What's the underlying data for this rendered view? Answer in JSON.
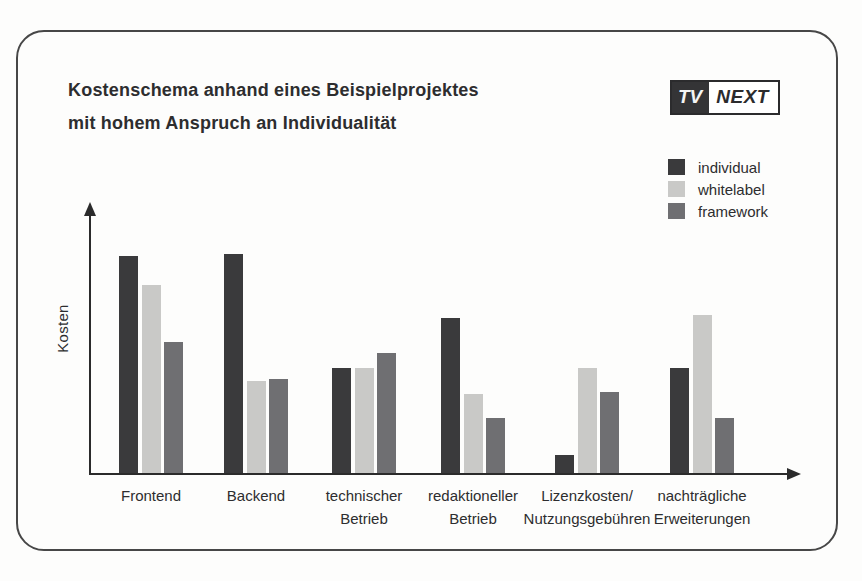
{
  "header": {
    "title_line1": "Kostenschema anhand eines Beispielprojektes",
    "title_line2": "mit hohem Anspruch an Individualität"
  },
  "logo": {
    "left_text": "TV",
    "right_text": "NEXT"
  },
  "colors": {
    "ink": "#2d2d2f",
    "axis": "#2b2b2b",
    "card_border": "#474747",
    "background": "#fdfdfc",
    "individual": "#3a3a3c",
    "whitelabel": "#c9c9c7",
    "framework": "#6f6f72"
  },
  "chart_data": {
    "type": "bar",
    "title": "Kostenschema anhand eines Beispielprojektes mit hohem Anspruch an Individualität",
    "xlabel": "",
    "ylabel": "Kosten",
    "ylim": [
      0,
      110
    ],
    "y_ticks": [],
    "grid": false,
    "legend_position": "top-right",
    "value_units": "relative (no numeric scale shown)",
    "categories": [
      "Frontend",
      "Backend",
      "technischer Betrieb",
      "redaktioneller Betrieb",
      "Lizenzkosten/Nutzungsgebühren",
      "nachträgliche Erweiterungen"
    ],
    "category_label_lines": [
      [
        "Frontend"
      ],
      [
        "Backend"
      ],
      [
        "technischer",
        "Betrieb"
      ],
      [
        "redaktioneller",
        "Betrieb"
      ],
      [
        "Lizenzkosten/",
        "Nutzungsgebühren"
      ],
      [
        "nachträgliche",
        "Erweiterungen"
      ]
    ],
    "series": [
      {
        "name": "individual",
        "color": "#3a3a3c",
        "values": [
          99,
          100,
          48,
          71,
          8,
          48
        ]
      },
      {
        "name": "whitelabel",
        "color": "#c9c9c7",
        "values": [
          86,
          42,
          48,
          36,
          48,
          72
        ]
      },
      {
        "name": "framework",
        "color": "#6f6f72",
        "values": [
          60,
          43,
          55,
          25,
          37,
          25
        ]
      }
    ]
  }
}
